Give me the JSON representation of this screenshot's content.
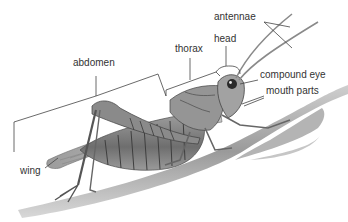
{
  "diagram": {
    "labels": {
      "antennae": "antennae",
      "head": "head",
      "thorax": "thorax",
      "abdomen": "abdomen",
      "compound_eye": "compound eye",
      "mouth_parts": "mouth parts",
      "wing": "wing"
    },
    "colors": {
      "text": "#333333",
      "leader_lines": "#444444",
      "body_dark": "#5a5a5a",
      "body_mid": "#8c8c8c",
      "body_light": "#bdbdbd",
      "stem": "#a8a8a8"
    }
  }
}
